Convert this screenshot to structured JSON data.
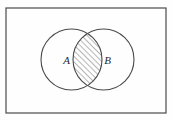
{
  "figure": {
    "kind": "venn-diagram",
    "background_color": "#fefefe",
    "stroke_color": "#4a4a4a",
    "hatch_color": "#4a4a4a",
    "label_color": "#2a2a2a",
    "universe": {
      "name": "universal-set-rectangle",
      "x": 6,
      "y": 8,
      "width": 160,
      "height": 105,
      "stroke_width": 1.2
    },
    "circles": [
      {
        "name": "set-a-circle",
        "label": "A",
        "cx": 71.5,
        "cy": 59.5,
        "r": 30.5,
        "stroke_width": 1.1
      },
      {
        "name": "set-b-circle",
        "label": "B",
        "cx": 103.5,
        "cy": 59.5,
        "r": 30.5,
        "stroke_width": 1.1
      }
    ],
    "labels": [
      {
        "name": "set-a-label",
        "text": "A",
        "x": 66.5,
        "y": 63.5
      },
      {
        "name": "set-b-label",
        "text": "B",
        "x": 107.5,
        "y": 63.5
      }
    ],
    "intersection": {
      "name": "intersection-region",
      "fill": "diagonal-hatch",
      "hatch_angle_deg": 45,
      "hatch_spacing": 4,
      "hatch_stroke_width": 0.8,
      "top_point": {
        "x": 87.5,
        "y": 37.5
      },
      "bottom_point": {
        "x": 87.5,
        "y": 81.5
      }
    }
  }
}
